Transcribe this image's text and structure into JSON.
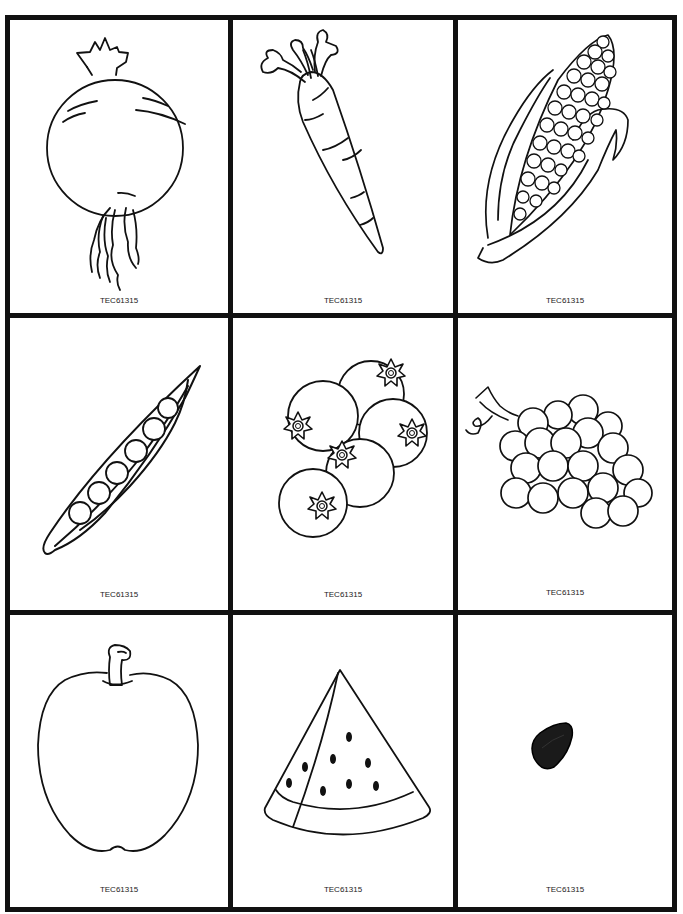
{
  "page": {
    "header_fragment": "· · · · · ·",
    "grid": {
      "rows": 3,
      "columns": 3,
      "border_color": "#111111"
    }
  },
  "cards": [
    {
      "name": "beet",
      "code": "TEC61315"
    },
    {
      "name": "carrot",
      "code": "TEC61315"
    },
    {
      "name": "corn",
      "code": "TEC61315"
    },
    {
      "name": "peas-in-pod",
      "code": "TEC61315"
    },
    {
      "name": "blueberries",
      "code": "TEC61315"
    },
    {
      "name": "grapes",
      "code": "TEC61315"
    },
    {
      "name": "apple",
      "code": "TEC61315"
    },
    {
      "name": "watermelon-slice",
      "code": "TEC61315"
    },
    {
      "name": "seed",
      "code": "TEC61315"
    }
  ]
}
